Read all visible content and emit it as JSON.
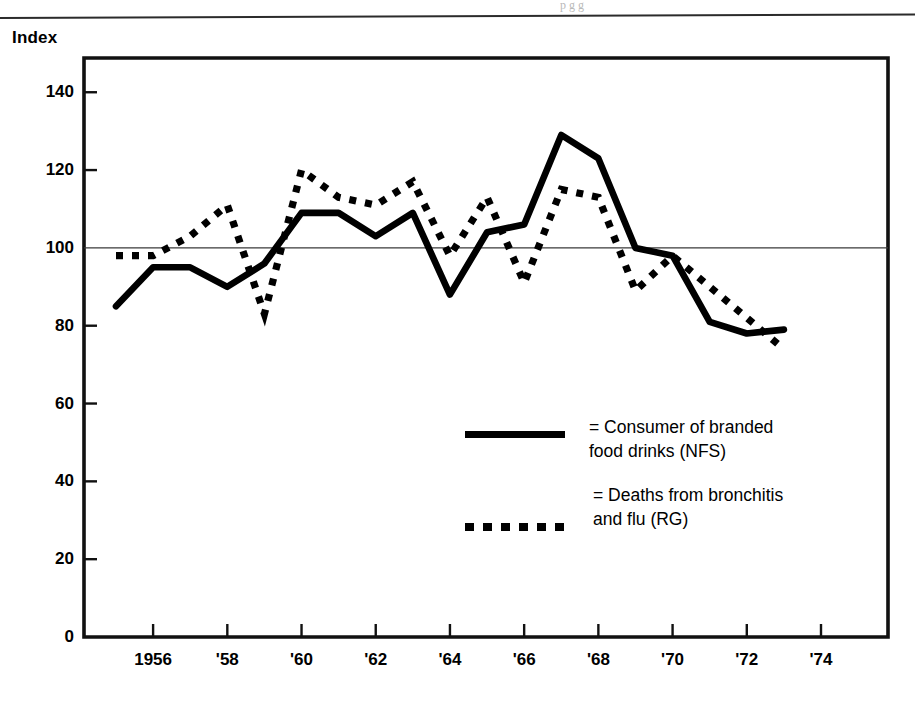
{
  "page": {
    "top_rule": true,
    "ghost_text": "p    g         g"
  },
  "axis": {
    "y_title": "Index",
    "y_ticks": [
      "140",
      "120",
      "100",
      "80",
      "60",
      "40",
      "20",
      "0"
    ],
    "x_ticks": [
      "1956",
      "'58",
      "'60",
      "'62",
      "'64",
      "'66",
      "'68",
      "'70",
      "'72",
      "'74"
    ]
  },
  "legend": {
    "items": [
      {
        "key": "solid-line-key",
        "label": "= Consumer of branded\nfood drinks (NFS)"
      },
      {
        "key": "dotted-line-key",
        "label": "= Deaths from bronchitis\nand flu (RG)"
      }
    ]
  },
  "chart_data": {
    "type": "line",
    "title": "",
    "xlabel": "",
    "ylabel": "Index",
    "xlim": [
      1955,
      1974
    ],
    "ylim": [
      0,
      148
    ],
    "ytick_values": [
      140,
      120,
      100,
      80,
      60,
      40,
      20,
      0
    ],
    "xtick_values": [
      1956,
      1958,
      1960,
      1962,
      1964,
      1966,
      1968,
      1970,
      1972,
      1974
    ],
    "xtick_labels": [
      "1956",
      "'58",
      "'60",
      "'62",
      "'64",
      "'66",
      "'68",
      "'70",
      "'72",
      "'74"
    ],
    "grid": false,
    "reference_line": 100,
    "legend_position": "center",
    "x": [
      1955,
      1956,
      1957,
      1958,
      1959,
      1960,
      1961,
      1962,
      1963,
      1964,
      1965,
      1966,
      1967,
      1968,
      1969,
      1970,
      1971,
      1972,
      1973
    ],
    "series": [
      {
        "name": "Consumer of branded food drinks (NFS)",
        "style": "solid",
        "color": "#000000",
        "values": [
          85,
          95,
          95,
          90,
          96,
          109,
          109,
          103,
          109,
          88,
          104,
          106,
          129,
          123,
          100,
          98,
          81,
          78,
          79
        ]
      },
      {
        "name": "Deaths from bronchitis and flu (RG)",
        "style": "dotted",
        "color": "#000000",
        "values": [
          98,
          98,
          103,
          111,
          83,
          120,
          113,
          111,
          117,
          98,
          113,
          91,
          115,
          113,
          89,
          98,
          90,
          82,
          74
        ]
      }
    ]
  }
}
